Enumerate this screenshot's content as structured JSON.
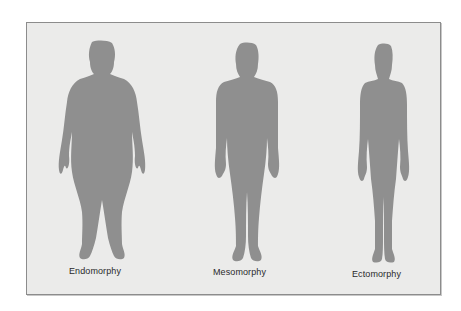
{
  "diagram": {
    "type": "somatotype-comparison",
    "colors": {
      "background": "#ebebea",
      "silhouette": "#8f8f8f",
      "border": "#8c8c8c",
      "text": "#2a2a2a"
    },
    "figures": [
      {
        "label": "Endomorphy",
        "body_type": "heavy-rounded"
      },
      {
        "label": "Mesomorphy",
        "body_type": "muscular-medium"
      },
      {
        "label": "Ectomorphy",
        "body_type": "slender-linear"
      }
    ]
  }
}
